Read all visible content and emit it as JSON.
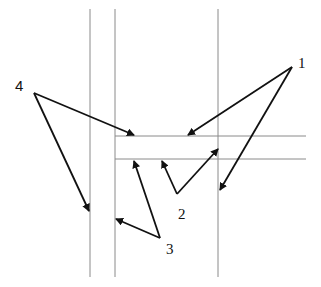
{
  "diagram": {
    "line_color": "#8a8a8a",
    "arrow_color": "#111111",
    "vertical_lines": [
      {
        "x": 90,
        "y1": 9,
        "y2": 277
      },
      {
        "x": 115,
        "y1": 9,
        "y2": 277
      },
      {
        "x": 218,
        "y1": 9,
        "y2": 277
      }
    ],
    "horizontal_lines": [
      {
        "y": 136,
        "x1": 115,
        "x2": 306
      },
      {
        "y": 159,
        "x1": 115,
        "x2": 306
      }
    ],
    "labels": [
      {
        "id": "1",
        "text": "1",
        "x": 298,
        "y": 56
      },
      {
        "id": "2",
        "text": "2",
        "x": 178,
        "y": 207
      },
      {
        "id": "3",
        "text": "3",
        "x": 166,
        "y": 242
      },
      {
        "id": "4",
        "text": "4",
        "x": 15,
        "y": 78
      }
    ],
    "arrows": [
      {
        "label": "1",
        "from": [
          292,
          67
        ],
        "to": [
          188,
          135
        ]
      },
      {
        "label": "1",
        "from": [
          292,
          67
        ],
        "to": [
          220,
          190
        ]
      },
      {
        "label": "2",
        "from": [
          177,
          194
        ],
        "to": [
          162,
          161
        ]
      },
      {
        "label": "2",
        "from": [
          177,
          194
        ],
        "to": [
          218,
          149
        ]
      },
      {
        "label": "3",
        "from": [
          160,
          238
        ],
        "to": [
          116,
          219
        ]
      },
      {
        "label": "3",
        "from": [
          160,
          238
        ],
        "to": [
          134,
          161
        ]
      },
      {
        "label": "4",
        "from": [
          34,
          93
        ],
        "to": [
          89,
          211
        ]
      },
      {
        "label": "4",
        "from": [
          34,
          93
        ],
        "to": [
          134,
          135
        ]
      }
    ]
  }
}
